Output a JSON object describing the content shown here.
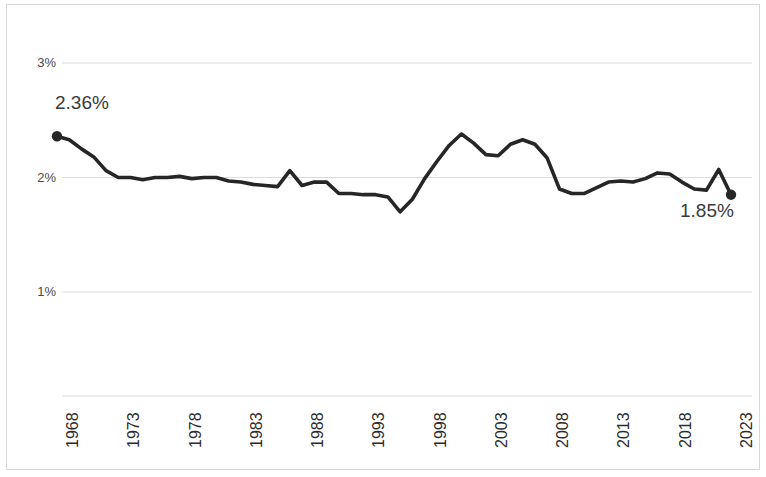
{
  "chart_data": {
    "type": "line",
    "title": "",
    "subtitle": "",
    "xlabel": "",
    "ylabel": "",
    "xlim": [
      1968,
      2023
    ],
    "ylim": [
      0.6,
      3.3
    ],
    "grid": "horizontal",
    "legend": "none",
    "y_ticks": [
      "1%",
      "2%",
      "3%"
    ],
    "y_tick_values": [
      1,
      2,
      3
    ],
    "x_ticks": [
      "1968",
      "1973",
      "1978",
      "1983",
      "1988",
      "1993",
      "1998",
      "2003",
      "2008",
      "2013",
      "2018",
      "2023"
    ],
    "x_tick_values": [
      1968,
      1973,
      1978,
      1983,
      1988,
      1993,
      1998,
      2003,
      2008,
      2013,
      2018,
      2023
    ],
    "line_color": "#262626",
    "grid_color": "#dcdcdc",
    "annotations": [
      {
        "label": "2.36%",
        "x": 1968,
        "y": 2.36
      },
      {
        "label": "1.85%",
        "x": 2023,
        "y": 1.85
      }
    ],
    "markers": [
      {
        "x": 1968,
        "y": 2.36
      },
      {
        "x": 2023,
        "y": 1.85
      }
    ],
    "x": [
      1968,
      1969,
      1970,
      1971,
      1972,
      1973,
      1974,
      1975,
      1976,
      1977,
      1978,
      1979,
      1980,
      1981,
      1982,
      1983,
      1984,
      1985,
      1986,
      1987,
      1988,
      1989,
      1990,
      1991,
      1992,
      1993,
      1994,
      1995,
      1996,
      1997,
      1998,
      1999,
      2000,
      2001,
      2002,
      2003,
      2004,
      2005,
      2006,
      2007,
      2008,
      2009,
      2010,
      2011,
      2012,
      2013,
      2014,
      2015,
      2016,
      2017,
      2018,
      2019,
      2020,
      2021,
      2022,
      2023
    ],
    "values": [
      2.36,
      2.33,
      2.25,
      2.18,
      2.06,
      2.0,
      2.0,
      1.98,
      2.0,
      2.0,
      2.01,
      1.99,
      2.0,
      2.0,
      1.97,
      1.96,
      1.94,
      1.93,
      1.92,
      2.06,
      1.93,
      1.96,
      1.96,
      1.86,
      1.86,
      1.85,
      1.85,
      1.83,
      1.7,
      1.81,
      1.99,
      2.14,
      2.28,
      2.38,
      2.3,
      2.2,
      2.19,
      2.29,
      2.33,
      2.29,
      2.17,
      1.9,
      1.86,
      1.86,
      1.91,
      1.96,
      1.97,
      1.96,
      1.99,
      2.04,
      2.03,
      1.96,
      1.9,
      1.89,
      2.07,
      1.85
    ],
    "series": [
      {
        "name": "rate",
        "values": [
          2.36,
          2.33,
          2.25,
          2.18,
          2.06,
          2.0,
          2.0,
          1.98,
          2.0,
          2.0,
          2.01,
          1.99,
          2.0,
          2.0,
          1.97,
          1.96,
          1.94,
          1.93,
          1.92,
          2.06,
          1.93,
          1.96,
          1.96,
          1.86,
          1.86,
          1.85,
          1.85,
          1.83,
          1.7,
          1.81,
          1.99,
          2.14,
          2.28,
          2.38,
          2.3,
          2.2,
          2.19,
          2.29,
          2.33,
          2.29,
          2.17,
          1.9,
          1.86,
          1.86,
          1.91,
          1.96,
          1.97,
          1.96,
          1.99,
          2.04,
          2.03,
          1.96,
          1.9,
          1.89,
          2.07,
          1.85
        ]
      }
    ]
  }
}
